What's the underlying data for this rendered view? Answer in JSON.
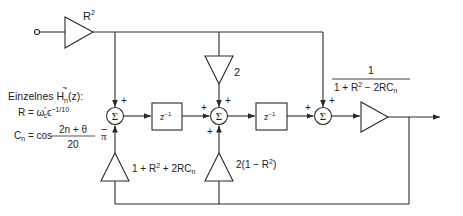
{
  "diagram": {
    "colors": {
      "line": "#2a2a2a",
      "background": "#ffffff",
      "text": "#222222"
    },
    "input_gain": {
      "label": "R",
      "sup": "2"
    },
    "feed_gain_middle": {
      "label": "2"
    },
    "output_gain": {
      "numerator": "1",
      "denominator_main": "1 + R",
      "denominator_sup": "2",
      "denominator_rest": " − 2RC",
      "denominator_sub": "n"
    },
    "feedback_gain_left": {
      "pre": "1 + R",
      "sup": "2",
      "post": " + 2RC",
      "sub": "n"
    },
    "feedback_gain_middle": {
      "pre": "2(1 − R",
      "sup": "2",
      "post": ")"
    },
    "summers": [
      {
        "symbol": "Σ",
        "top_sign": "+",
        "bottom_sign": "−",
        "left_sign": ""
      },
      {
        "symbol": "Σ",
        "top_sign": "+",
        "bottom_sign": "+",
        "left_sign": "+"
      },
      {
        "symbol": "Σ",
        "top_sign": "+",
        "bottom_sign": "",
        "left_sign": "+"
      }
    ],
    "delays": [
      {
        "label": "z",
        "sup": "−1"
      },
      {
        "label": "z",
        "sup": "−1"
      }
    ],
    "legend": {
      "heading_pre": "Einzelnes ",
      "heading_H": "H",
      "heading_tilde": "~",
      "heading_sub": "n",
      "heading_post": "(z):",
      "r_eq_pre": "R = ω",
      "r_eq_omega_sup": "′",
      "r_eq_omega_sub": "c",
      "r_eq_eps": "ϵ",
      "r_eq_exp": "−1/10",
      "c_eq_lhs": "C",
      "c_eq_lhs_sub": "n",
      "c_eq_mid": " = cos",
      "c_eq_num": "2n + θ",
      "c_eq_den": "20",
      "c_eq_pi": "π"
    }
  }
}
